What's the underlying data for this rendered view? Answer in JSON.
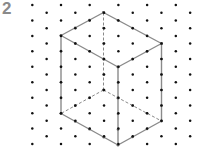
{
  "figure": {
    "number_label": "2",
    "colors": {
      "dots": "#111111",
      "edges": "#8a8a8a",
      "label": "#8a8a8a"
    }
  },
  "grid": {
    "columns": 12,
    "rows_per_column": 10
  },
  "cuboid": {
    "units": {
      "width_left": 3,
      "width_right": 3,
      "height": 5
    },
    "solid_edges": [
      "top-back-left",
      "top-back-right",
      "top-front-left",
      "top-front-right",
      "vert-left",
      "vert-front",
      "vert-right",
      "bottom-front-left",
      "bottom-front-right"
    ],
    "hidden_edges": [
      "vert-back",
      "bottom-back-left",
      "bottom-back-right"
    ]
  }
}
